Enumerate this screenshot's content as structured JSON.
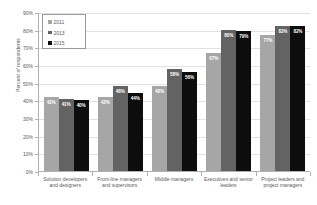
{
  "chart_data": {
    "type": "bar",
    "title": "",
    "xlabel": "",
    "ylabel": "Percent of respondents",
    "ylim": [
      0,
      90
    ],
    "ytick_labels": [
      "90%",
      "80%",
      "70%",
      "60%",
      "50%",
      "40%",
      "30%",
      "20%",
      "10%",
      "0%"
    ],
    "ytick_values": [
      90,
      80,
      70,
      60,
      50,
      40,
      30,
      20,
      10,
      0
    ],
    "grid": true,
    "legend_position": "top-left",
    "categories": [
      "Solution developers and designers",
      "Front-line managers and supervisors",
      "Middle managers",
      "Executives and senior leaders",
      "Project leaders and project managers"
    ],
    "series": [
      {
        "name": "2011",
        "color": "#a6a6a6",
        "values": [
          42,
          42,
          48,
          67,
          77
        ],
        "labels": [
          "42%",
          "42%",
          "48%",
          "67%",
          "77%"
        ]
      },
      {
        "name": "2013",
        "color": "#636363",
        "values": [
          41,
          48,
          58,
          80,
          82
        ],
        "labels": [
          "41%",
          "48%",
          "58%",
          "80%",
          "82%"
        ]
      },
      {
        "name": "2015",
        "color": "#0d0d0d",
        "values": [
          40,
          44,
          56,
          79,
          82
        ],
        "labels": [
          "40%",
          "44%",
          "56%",
          "79%",
          "82%"
        ]
      }
    ]
  }
}
